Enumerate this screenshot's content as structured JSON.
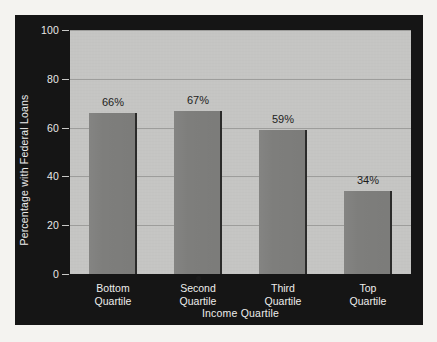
{
  "chart_data": {
    "type": "bar",
    "title": "",
    "xlabel": "Income Quartile",
    "ylabel": "Percentage with Federal Loans",
    "categories": [
      "Bottom Quartile",
      "Second Quartile",
      "Third Quartile",
      "Top Quartile"
    ],
    "category_lines": [
      [
        "Bottom",
        "Quartile"
      ],
      [
        "Second",
        "Quartile"
      ],
      [
        "Third",
        "Quartile"
      ],
      [
        "Top",
        "Quartile"
      ]
    ],
    "values": [
      66,
      67,
      59,
      34
    ],
    "data_labels": [
      "66%",
      "67%",
      "59%",
      "34%"
    ],
    "ylim": [
      0,
      100
    ],
    "yticks": [
      0,
      20,
      40,
      60,
      80,
      100
    ],
    "ytick_labels": [
      "0",
      "20",
      "40",
      "60",
      "80",
      "100"
    ],
    "grid": true,
    "grid_axis": "y",
    "legend": "none",
    "colors": {
      "panel_background": "#151515",
      "plot_background": "#c5c5c3",
      "bar_fill": "#7e7e7c",
      "bar_edge": "#2b2b2a",
      "gridline": "#9d9d9b",
      "axis_text": "#ededec",
      "data_label_text": "#1d1d1c",
      "page_background": "#f4f3f0"
    }
  }
}
